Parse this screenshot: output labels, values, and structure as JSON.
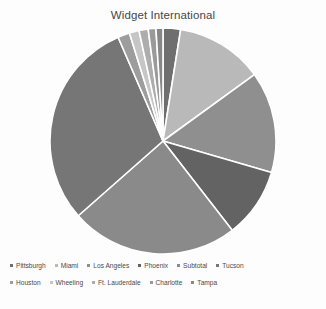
{
  "chart_data": {
    "type": "pie",
    "title": "Widget International",
    "xlabel": "",
    "ylabel": "",
    "legend_position": "bottom",
    "grid": false,
    "start_angle_deg": -90,
    "direction": "clockwise",
    "categories": [
      "Pittsburgh",
      "Miami",
      "Los Angeles",
      "Phoenix",
      "Subtotal",
      "Tucson",
      "Houston",
      "Wheeling",
      "Ft. Lauderdale",
      "Charlotte",
      "Tampa"
    ],
    "values": [
      2.5,
      12.5,
      14.5,
      10.0,
      24.0,
      30.0,
      1.7,
      1.4,
      1.3,
      1.1,
      1.0
    ],
    "colors": [
      "#6f6f6f",
      "#b9b9b9",
      "#8f8f8f",
      "#636363",
      "#8a8a8a",
      "#767676",
      "#9d9d9d",
      "#c6c6c6",
      "#adadad",
      "#9a9a9a",
      "#878787"
    ]
  },
  "chart": {
    "title": "Widget International"
  },
  "legend": {
    "rows": [
      [
        {
          "label": "Pittsburgh",
          "color": "#6f6f6f"
        },
        {
          "label": "Miami",
          "color": "#b9b9b9"
        },
        {
          "label": "Los Angeles",
          "color": "#8f8f8f"
        },
        {
          "label": "Phoenix",
          "color": "#636363"
        },
        {
          "label": "Subtotal",
          "color": "#8a8a8a"
        },
        {
          "label": "Tucson",
          "color": "#767676"
        }
      ],
      [
        {
          "label": "Houston",
          "color": "#9d9d9d"
        },
        {
          "label": "Wheeling",
          "color": "#c6c6c6"
        },
        {
          "label": "Ft. Lauderdale",
          "color": "#adadad"
        },
        {
          "label": "Charlotte",
          "color": "#9a9a9a"
        },
        {
          "label": "Tampa",
          "color": "#878787"
        }
      ]
    ]
  }
}
